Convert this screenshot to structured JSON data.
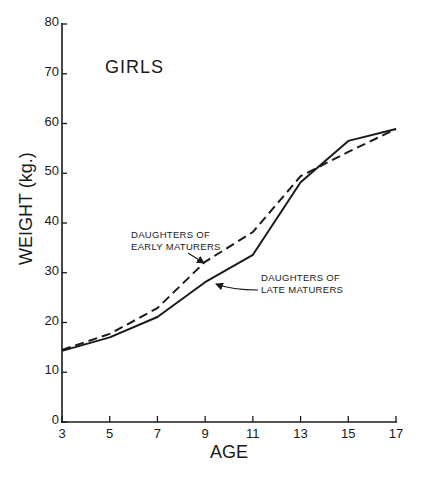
{
  "chart_data": {
    "type": "line",
    "title": "GIRLS",
    "xlabel": "AGE",
    "ylabel": "WEIGHT (kg.)",
    "x": [
      3,
      5,
      7,
      9,
      11,
      13,
      15,
      17
    ],
    "xlim": [
      3,
      17
    ],
    "ylim": [
      0,
      80
    ],
    "x_ticks": [
      "3",
      "5",
      "7",
      "9",
      "11",
      "13",
      "15",
      "17"
    ],
    "y_ticks": [
      "0",
      "10",
      "20",
      "30",
      "40",
      "50",
      "60",
      "70",
      "80"
    ],
    "grid": false,
    "legend": "none (inline annotations with arrows)",
    "series": [
      {
        "name": "Daughters of Early Maturers",
        "style": "dashed",
        "values": [
          14.5,
          17.7,
          22.9,
          32.2,
          38.2,
          49.4,
          54.3,
          58.9
        ]
      },
      {
        "name": "Daughters of Late Maturers",
        "style": "solid",
        "values": [
          14.3,
          17.0,
          21.1,
          28.1,
          33.6,
          48.2,
          56.5,
          58.9
        ]
      }
    ],
    "annotations": [
      {
        "lines": [
          "DAUGHTERS OF",
          "EARLY MATURERS"
        ],
        "points_to": "dashed series near age 9"
      },
      {
        "lines": [
          "DAUGHTERS OF",
          "LATE MATURERS"
        ],
        "points_to": "solid series near age 10"
      }
    ]
  },
  "labels": {
    "title": "GIRLS",
    "xlabel": "AGE",
    "ylabel": "WEIGHT (kg.)",
    "early_line1": "DAUGHTERS OF",
    "early_line2": "EARLY MATURERS",
    "late_line1": "DAUGHTERS OF",
    "late_line2": "LATE MATURERS"
  },
  "style": {
    "ink": "#1a1a1a",
    "background": "#ffffff"
  }
}
